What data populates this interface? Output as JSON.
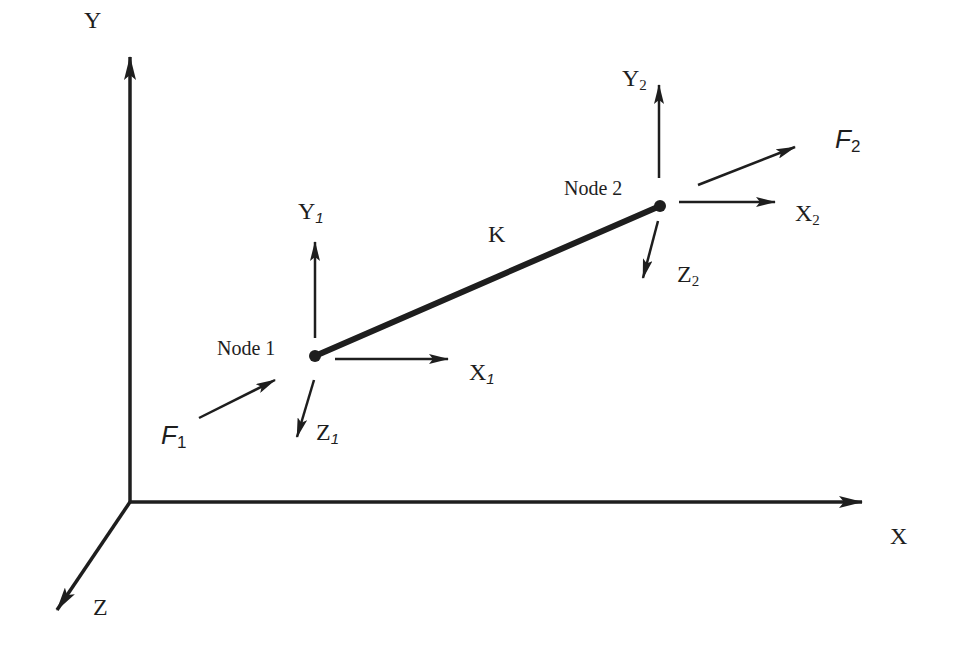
{
  "diagram": {
    "title": "",
    "global_axes": {
      "y": {
        "label": "Y"
      },
      "x": {
        "label": "X"
      },
      "z": {
        "label": "Z"
      }
    },
    "element": {
      "label": "K",
      "connects": [
        "Node 1",
        "Node 2"
      ]
    },
    "nodes": [
      {
        "label": "Node 1",
        "axes": {
          "x": {
            "base": "X",
            "sub": "1"
          },
          "y": {
            "base": "Y",
            "sub": "1"
          },
          "z": {
            "base": "Z",
            "sub": "1"
          }
        },
        "force": {
          "base": "F",
          "sub": "1"
        }
      },
      {
        "label": "Node 2",
        "axes": {
          "x": {
            "base": "X",
            "sub": "2"
          },
          "y": {
            "base": "Y",
            "sub": "2"
          },
          "z": {
            "base": "Z",
            "sub": "2"
          }
        },
        "force": {
          "base": "F",
          "sub": "2"
        }
      }
    ],
    "colors": {
      "ink": "#1e1e1e",
      "background": "#ffffff"
    }
  }
}
